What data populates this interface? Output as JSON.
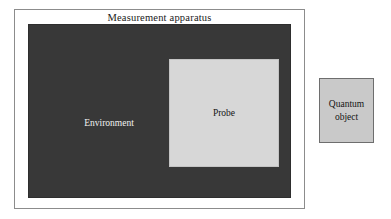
{
  "figure": {
    "type": "schematic-diagram",
    "background_color": "#ffffff"
  },
  "apparatus": {
    "title": "Measurement apparatus",
    "border_color": "#8c8c8c",
    "fill_color": "#ffffff"
  },
  "environment": {
    "label": "Environment",
    "fill_color": "#383838",
    "text_color": "#f2f2f2"
  },
  "probe": {
    "label": "Probe",
    "fill_color": "#d7d7d7",
    "text_color": "#141414"
  },
  "quantum_object": {
    "line1": "Quantum",
    "line2": "object",
    "fill_color": "#c9c9c9",
    "border_color": "#6e6e6e",
    "text_color": "#141414"
  }
}
